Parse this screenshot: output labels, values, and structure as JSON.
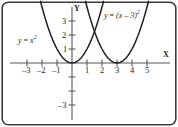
{
  "figure": {
    "kind": "cartesian-graph",
    "border_color": "#3b3b3b",
    "background": "#ffffff",
    "curve_color": "#231f20",
    "axis_color": "#58595b",
    "text_color": "#231f20"
  },
  "axes": {
    "x_letter": "X",
    "y_letter": "Y",
    "x_ticks": [
      {
        "value": -3,
        "label": "–3"
      },
      {
        "value": -2,
        "label": "–2"
      },
      {
        "value": -1,
        "label": "–1"
      },
      {
        "value": 1,
        "label": "1"
      },
      {
        "value": 2,
        "label": "2"
      },
      {
        "value": 3,
        "label": "3"
      },
      {
        "value": 4,
        "label": "4"
      },
      {
        "value": 5,
        "label": "5"
      }
    ],
    "y_ticks": [
      {
        "value": 3,
        "label": "3"
      },
      {
        "value": 2,
        "label": "2"
      },
      {
        "value": 1,
        "label": "1"
      },
      {
        "value": -1,
        "label": ""
      },
      {
        "value": -2,
        "label": ""
      },
      {
        "value": -3,
        "label": "–3"
      }
    ]
  },
  "curve_labels": {
    "left": {
      "lhs": "y",
      "eq": "=",
      "base": "x",
      "exp": "2"
    },
    "right": {
      "lhs": "y",
      "eq": "=",
      "base": "(x – 3)",
      "exp": "2"
    }
  },
  "chart_data": {
    "type": "line",
    "title": "",
    "xlabel": "X",
    "ylabel": "Y",
    "xlim": [
      -3.9,
      5.9
    ],
    "ylim": [
      -3.9,
      4.3
    ],
    "grid": false,
    "legend": "inline-annotations",
    "series": [
      {
        "name": "y = x^2",
        "equation": "y = x^2",
        "vertex": [
          0,
          0
        ],
        "x": [
          -2.1,
          -1.8,
          -1.5,
          -1.2,
          -0.9,
          -0.6,
          -0.3,
          0,
          0.3,
          0.6,
          0.9,
          1.2,
          1.5,
          1.8,
          2.1
        ],
        "y": [
          4.41,
          3.24,
          2.25,
          1.44,
          0.81,
          0.36,
          0.09,
          0,
          0.09,
          0.36,
          0.81,
          1.44,
          2.25,
          3.24,
          4.41
        ]
      },
      {
        "name": "y = (x - 3)^2",
        "equation": "y = (x - 3)^2",
        "vertex": [
          3,
          0
        ],
        "x": [
          0.9,
          1.2,
          1.5,
          1.8,
          2.1,
          2.4,
          2.7,
          3,
          3.3,
          3.6,
          3.9,
          4.2,
          4.5,
          4.8,
          5.1
        ],
        "y": [
          4.41,
          3.24,
          2.25,
          1.44,
          0.81,
          0.36,
          0.09,
          0,
          0.09,
          0.36,
          0.81,
          1.44,
          2.25,
          3.24,
          4.41
        ]
      }
    ],
    "intersection": [
      1.5,
      2.25
    ]
  }
}
